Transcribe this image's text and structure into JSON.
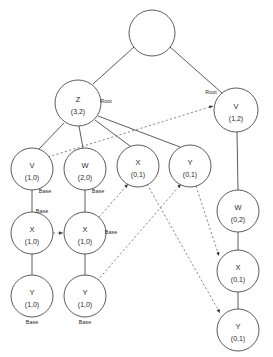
{
  "diagram": {
    "colors": {
      "background": "#ffffff",
      "node_stroke": "#4a4a4a",
      "node_fill": "#ffffff",
      "solid_edge": "#4a4a4a",
      "dashed_edge": "#6b6b6b",
      "text": "#2b2b2b"
    },
    "nodes": [
      {
        "id": "n0",
        "label": "",
        "sub": "",
        "cx": 152,
        "cy": 33,
        "r": 23
      },
      {
        "id": "n1",
        "label": "Z",
        "sub": "(3,2)",
        "cx": 78,
        "cy": 103,
        "r": 23
      },
      {
        "id": "n2",
        "label": "V",
        "sub": "(1,2)",
        "cx": 236,
        "cy": 110,
        "r": 22
      },
      {
        "id": "n3",
        "label": "V",
        "sub": "(1,0)",
        "cx": 32,
        "cy": 169,
        "r": 21
      },
      {
        "id": "n4",
        "label": "W",
        "sub": "(2,0)",
        "cx": 85,
        "cy": 169,
        "r": 21
      },
      {
        "id": "n5",
        "label": "X",
        "sub": "(0,1)",
        "cx": 138,
        "cy": 166,
        "r": 21
      },
      {
        "id": "n6",
        "label": "Y",
        "sub": "(0,1)",
        "cx": 190,
        "cy": 166,
        "r": 21
      },
      {
        "id": "n7",
        "label": "X",
        "sub": "(1,0)",
        "cx": 32,
        "cy": 233,
        "r": 21
      },
      {
        "id": "n8",
        "label": "X",
        "sub": "(1,0)",
        "cx": 85,
        "cy": 233,
        "r": 21
      },
      {
        "id": "n9",
        "label": "Y",
        "sub": "(1,0)",
        "cx": 32,
        "cy": 296,
        "r": 21
      },
      {
        "id": "n10",
        "label": "Y",
        "sub": "(1,0)",
        "cx": 85,
        "cy": 296,
        "r": 21
      },
      {
        "id": "n11",
        "label": "W",
        "sub": "(0,2)",
        "cx": 238,
        "cy": 211,
        "r": 21
      },
      {
        "id": "n12",
        "label": "X",
        "sub": "(0,1)",
        "cx": 238,
        "cy": 271,
        "r": 21
      },
      {
        "id": "n13",
        "label": "Y",
        "sub": "(0,1)",
        "cx": 238,
        "cy": 330,
        "r": 21
      }
    ],
    "solid_edges": [
      {
        "name": "edge-root-to-z",
        "x1": 134,
        "y1": 47,
        "x2": 93,
        "y2": 84
      },
      {
        "name": "edge-root-to-v",
        "x1": 170,
        "y1": 47,
        "x2": 222,
        "y2": 93
      },
      {
        "name": "edge-z-to-v10",
        "x1": 64,
        "y1": 123,
        "x2": 39,
        "y2": 149
      },
      {
        "name": "edge-z-to-w20",
        "x1": 79,
        "y1": 126,
        "x2": 83,
        "y2": 148
      },
      {
        "name": "edge-z-to-x01",
        "x1": 95,
        "y1": 120,
        "x2": 130,
        "y2": 146
      },
      {
        "name": "edge-z-to-y01",
        "x1": 98,
        "y1": 116,
        "x2": 180,
        "y2": 147
      },
      {
        "name": "edge-v10-to-x10",
        "x1": 32,
        "y1": 190,
        "x2": 32,
        "y2": 212
      },
      {
        "name": "edge-w20-to-x10",
        "x1": 85,
        "y1": 190,
        "x2": 85,
        "y2": 212
      },
      {
        "name": "edge-x10-to-y10",
        "x1": 32,
        "y1": 254,
        "x2": 32,
        "y2": 275
      },
      {
        "name": "edge-x10b-to-y10b",
        "x1": 85,
        "y1": 254,
        "x2": 85,
        "y2": 275
      },
      {
        "name": "edge-v12-to-w02",
        "x1": 237,
        "y1": 132,
        "x2": 238,
        "y2": 190
      },
      {
        "name": "edge-w02-to-x01",
        "x1": 238,
        "y1": 232,
        "x2": 238,
        "y2": 250
      },
      {
        "name": "edge-x01-to-y01",
        "x1": 238,
        "y1": 292,
        "x2": 238,
        "y2": 309
      }
    ],
    "dashed_edges": [
      {
        "name": "dep-v10-to-v12",
        "x1": 48,
        "y1": 157,
        "x2": 213,
        "y2": 106
      },
      {
        "name": "dep-x10-to-x10b",
        "x1": 53,
        "y1": 233,
        "x2": 63,
        "y2": 233
      },
      {
        "name": "dep-x10b-to-x01",
        "x1": 99,
        "y1": 217,
        "x2": 128,
        "y2": 184
      },
      {
        "name": "dep-y10b-to-y01",
        "x1": 97,
        "y1": 281,
        "x2": 181,
        "y2": 184
      },
      {
        "name": "dep-y01-to-x01r",
        "x1": 196,
        "y1": 186,
        "x2": 219,
        "y2": 256
      },
      {
        "name": "dep-x01-to-y01r",
        "x1": 147,
        "y1": 184,
        "x2": 220,
        "y2": 313
      }
    ],
    "edge_labels": [
      {
        "name": "label-root-z",
        "text": "Root",
        "x": 106,
        "y": 103
      },
      {
        "name": "label-root-v",
        "text": "Root",
        "x": 211,
        "y": 94
      },
      {
        "name": "label-base-v10",
        "text": "Base",
        "x": 45,
        "y": 193
      },
      {
        "name": "label-base-x10",
        "text": "Base",
        "x": 42,
        "y": 213
      },
      {
        "name": "label-base-w20",
        "text": "Base",
        "x": 98,
        "y": 193
      },
      {
        "name": "label-base-x10b",
        "text": "Base",
        "x": 111,
        "y": 234
      },
      {
        "name": "label-base-y10",
        "text": "Base",
        "x": 32,
        "y": 324
      },
      {
        "name": "label-base-y10b",
        "text": "Base",
        "x": 85,
        "y": 324
      }
    ]
  }
}
